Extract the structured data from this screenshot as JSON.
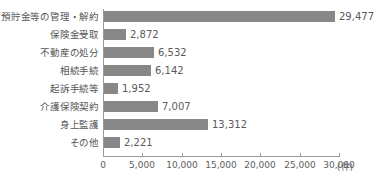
{
  "chart_data": {
    "type": "bar",
    "orientation": "horizontal",
    "title": "",
    "subtitle": "",
    "xlabel": "(件)",
    "ylabel": "",
    "categories": [
      "預貯金等の管理・解約",
      "保険金受取",
      "不動産の処分",
      "相続手続",
      "起訴手続等",
      "介護保険契約",
      "身上監護",
      "その他"
    ],
    "values": [
      29477,
      2872,
      6532,
      6142,
      1952,
      7007,
      13312,
      2221
    ],
    "value_labels": [
      "29,477",
      "2,872",
      "6,532",
      "6,142",
      "1,952",
      "7,007",
      "13,312",
      "2,221"
    ],
    "xlim": [
      0,
      30000
    ],
    "xticks": [
      0,
      5000,
      10000,
      15000,
      20000,
      25000,
      30000
    ],
    "xtick_labels": [
      "0",
      "5,000",
      "10,000",
      "15,000",
      "20,000",
      "25,000",
      "30,000"
    ],
    "unit": "(件)",
    "grid": false,
    "legend": false,
    "bar_color": "#878787",
    "axis_color": "#9a9a9a",
    "text_color": "#555555",
    "background": "#ffffff"
  }
}
